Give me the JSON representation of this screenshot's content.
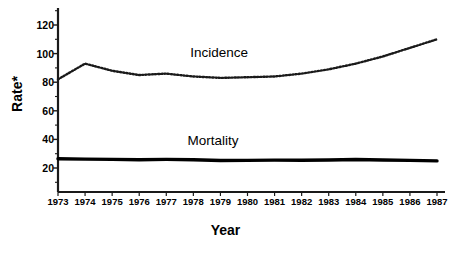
{
  "chart_data": {
    "type": "line",
    "title": "",
    "xlabel": "Year",
    "ylabel": "Rate*",
    "x": [
      1973,
      1974,
      1975,
      1976,
      1977,
      1978,
      1979,
      1980,
      1981,
      1982,
      1983,
      1984,
      1985,
      1986,
      1987
    ],
    "xtick_labels": [
      "1973",
      "1974",
      "1975",
      "1976",
      "1977",
      "1978",
      "1979",
      "1980",
      "1981",
      "1982",
      "1983",
      "1984",
      "1985",
      "1986",
      "1987"
    ],
    "ytick_labels": [
      "20",
      "40",
      "60",
      "80",
      "100",
      "120"
    ],
    "ytick_values": [
      20,
      40,
      60,
      80,
      100,
      120
    ],
    "ylim": [
      8,
      128
    ],
    "xlim": [
      1973,
      1987
    ],
    "grid": false,
    "legend_position": "inline-annotation",
    "series": [
      {
        "name": "Incidence",
        "style": "dotted",
        "color": "#1a1a1a",
        "label_x": 1979.1,
        "label_y": 100,
        "values": [
          82,
          93,
          88,
          85,
          86,
          84,
          83,
          83.5,
          84,
          86,
          89,
          93,
          98,
          104,
          110
        ]
      },
      {
        "name": "Mortality",
        "style": "solid-bold",
        "color": "#000000",
        "label_x": 1979.0,
        "label_y": 38,
        "values": [
          26.5,
          26.2,
          26.0,
          25.8,
          26.0,
          25.8,
          25.2,
          25.3,
          25.5,
          25.4,
          25.6,
          25.9,
          25.6,
          25.3,
          25.0
        ]
      }
    ]
  },
  "axes": {
    "y_title": "Rate*",
    "x_title": "Year"
  },
  "colors": {
    "axis": "#1a1a1a",
    "incidence": "#1a1a1a",
    "mortality": "#000000",
    "background": "#ffffff"
  }
}
